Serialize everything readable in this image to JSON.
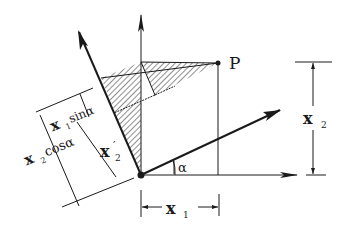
{
  "diagram": {
    "labels": {
      "point": "P",
      "x1": "x",
      "x1_sub": "1",
      "x2": "x",
      "x2_sub": "2",
      "x2_prime": "x",
      "x2_prime_sub": "2",
      "x2_prime_mark": "′",
      "x1_sin": "x",
      "x1_sin_sub": "1",
      "x1_sin_rest": "sinα",
      "x2_cos": "x",
      "x2_cos_sub": "2",
      "x2_cos_rest": "cosα",
      "angle": "α"
    },
    "colors": {
      "ink": "#1a1a1a",
      "hatch": "#333333",
      "background": "#ffffff"
    }
  }
}
